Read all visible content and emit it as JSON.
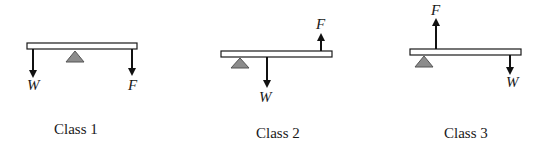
{
  "diagram": {
    "colors": {
      "beam_fill": "#ffffff",
      "beam_stroke": "#1a1a1a",
      "fulcrum": "#8c8c8c",
      "arrow": "#111111"
    },
    "levers": [
      {
        "name": "Class 1",
        "caption": "Class 1",
        "arrangement": "fulcrum between load and effort",
        "load_label": "W",
        "effort_label": "F",
        "load_direction": "down",
        "effort_direction": "down"
      },
      {
        "name": "Class 2",
        "caption": "Class 2",
        "arrangement": "load between fulcrum and effort",
        "load_label": "W",
        "effort_label": "F",
        "load_direction": "down",
        "effort_direction": "up"
      },
      {
        "name": "Class 3",
        "caption": "Class 3",
        "arrangement": "effort between fulcrum and load",
        "load_label": "W",
        "effort_label": "F",
        "load_direction": "down",
        "effort_direction": "up"
      }
    ]
  }
}
